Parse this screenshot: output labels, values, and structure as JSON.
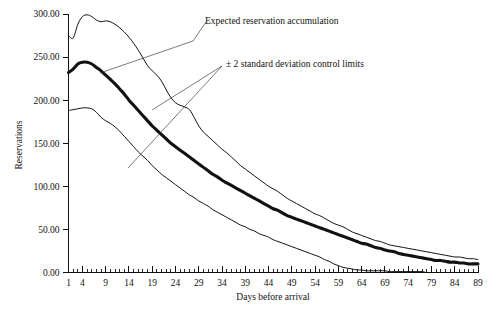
{
  "chart_data": {
    "type": "line",
    "title": "",
    "xlabel": "Days before arrival",
    "ylabel": "Reservations",
    "xlim": [
      1,
      89
    ],
    "ylim": [
      0,
      300
    ],
    "grid": false,
    "legend_position": "inline-annotations",
    "ytick_labels": [
      "0.00",
      "50.00",
      "100.00",
      "150.00",
      "200.00",
      "250.00",
      "300.00"
    ],
    "ytick_values": [
      0,
      50,
      100,
      150,
      200,
      250,
      300
    ],
    "xtick_labels": [
      "1",
      "4",
      "9",
      "14",
      "19",
      "24",
      "29",
      "34",
      "39",
      "44",
      "49",
      "54",
      "59",
      "64",
      "69",
      "74",
      "79",
      "84",
      "89"
    ],
    "xtick_values": [
      1,
      4,
      9,
      14,
      19,
      24,
      29,
      34,
      39,
      44,
      49,
      54,
      59,
      64,
      69,
      74,
      79,
      84,
      89
    ],
    "minor_tick_interval": 1,
    "x": [
      1,
      2,
      3,
      4,
      5,
      6,
      7,
      8,
      9,
      10,
      11,
      12,
      13,
      14,
      15,
      16,
      17,
      18,
      19,
      20,
      21,
      22,
      23,
      24,
      25,
      26,
      27,
      28,
      29,
      30,
      31,
      32,
      33,
      34,
      35,
      36,
      37,
      38,
      39,
      40,
      41,
      42,
      43,
      44,
      45,
      46,
      47,
      48,
      49,
      50,
      51,
      52,
      53,
      54,
      55,
      56,
      57,
      58,
      59,
      60,
      61,
      62,
      63,
      64,
      65,
      66,
      67,
      68,
      69,
      70,
      71,
      72,
      73,
      74,
      75,
      76,
      77,
      78,
      79,
      80,
      81,
      82,
      83,
      84,
      85,
      86,
      87,
      88,
      89
    ],
    "series": [
      {
        "name": "Upper control limit (+2 standard deviations)",
        "style": "thin",
        "values": [
          275,
          272,
          288,
          297,
          299,
          297,
          293,
          291,
          292,
          291,
          288,
          284,
          279,
          273,
          266,
          258,
          249,
          240,
          234,
          229,
          222,
          212,
          203,
          197,
          194,
          192,
          189,
          180,
          170,
          163,
          158,
          153,
          148,
          143,
          139,
          134,
          129,
          124,
          120,
          116,
          112,
          108,
          104,
          100,
          97,
          94,
          90,
          86,
          83,
          80,
          77,
          74,
          71,
          68,
          66,
          63,
          60,
          57,
          55,
          53,
          50,
          47,
          45,
          43,
          41,
          39,
          37,
          36,
          34,
          32,
          31,
          30,
          29,
          28,
          27,
          26,
          25,
          24,
          23,
          22,
          21,
          20,
          19,
          18,
          18,
          17,
          16,
          16,
          15
        ]
      },
      {
        "name": "Expected reservation accumulation",
        "style": "thick",
        "values": [
          232,
          236,
          242,
          244,
          244,
          242,
          238,
          234,
          229,
          224,
          219,
          213,
          207,
          200,
          194,
          188,
          182,
          176,
          170,
          165,
          160,
          155,
          150,
          146,
          142,
          138,
          134,
          130,
          126,
          122,
          118,
          114,
          111,
          107,
          104,
          101,
          98,
          95,
          92,
          89,
          86,
          83,
          80,
          77,
          74,
          72,
          69,
          66,
          64,
          62,
          60,
          58,
          56,
          54,
          52,
          50,
          48,
          46,
          44,
          42,
          40,
          38,
          36,
          34,
          33,
          31,
          29,
          28,
          26,
          25,
          24,
          22,
          21,
          20,
          19,
          18,
          17,
          16,
          15,
          14,
          14,
          13,
          12,
          12,
          11,
          11,
          10,
          10,
          10
        ]
      },
      {
        "name": "Lower control limit (-2 standard deviations)",
        "style": "thin",
        "values": [
          188,
          189,
          190,
          191,
          191,
          190,
          186,
          180,
          176,
          173,
          169,
          164,
          158,
          152,
          146,
          140,
          135,
          130,
          124,
          119,
          114,
          110,
          106,
          102,
          98,
          94,
          90,
          87,
          83,
          80,
          77,
          73,
          70,
          67,
          64,
          61,
          58,
          55,
          53,
          50,
          48,
          45,
          43,
          41,
          38,
          36,
          34,
          32,
          30,
          28,
          26,
          24,
          22,
          20,
          18,
          15,
          13,
          10,
          8,
          6,
          5,
          4,
          3,
          3,
          2,
          2,
          2,
          2,
          2,
          1,
          1,
          1,
          1,
          1,
          1,
          1,
          1,
          0,
          0,
          0,
          0,
          0,
          0,
          0,
          0,
          0,
          0,
          0,
          0
        ]
      }
    ],
    "annotations": [
      {
        "id": "expected-annotation",
        "text": "Expected reservation accumulation",
        "points_to": "expected reservation accumulation line"
      },
      {
        "id": "control-limits-annotation",
        "text": "± 2 standard deviation control limits",
        "points_to": "upper and lower control limit lines"
      }
    ],
    "colors": {
      "line": "#111111",
      "background": "#ffffff",
      "text": "#111111",
      "leader": "#333333"
    }
  }
}
